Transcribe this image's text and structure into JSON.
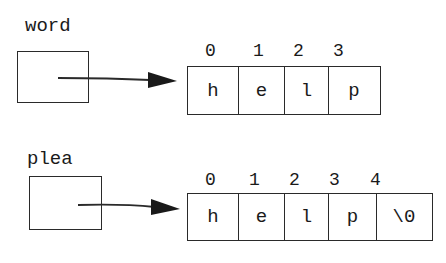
{
  "diagrams": [
    {
      "variable": "word",
      "indices": [
        "0",
        "1",
        "2",
        "3"
      ],
      "cells": [
        "h",
        "e",
        "l",
        "p"
      ]
    },
    {
      "variable": "plea",
      "indices": [
        "0",
        "1",
        "2",
        "3",
        "4"
      ],
      "cells": [
        "h",
        "e",
        "l",
        "p",
        "\\0"
      ]
    }
  ],
  "colors": {
    "stroke": "#2a2a2a",
    "background": "#ffffff"
  }
}
